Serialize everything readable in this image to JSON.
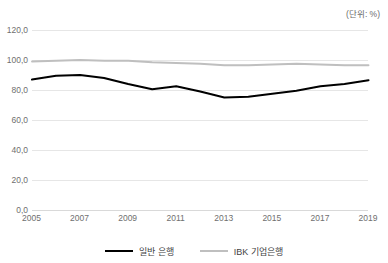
{
  "header": {
    "title_clipped": "",
    "unit_label": "(단위: %)"
  },
  "legend": {
    "position": "bottom",
    "items": [
      {
        "label": "일반 은행",
        "color": "#000000"
      },
      {
        "label": "IBK 기업은행",
        "color": "#bfbfbf"
      }
    ]
  },
  "axis": {
    "y_ticks": [
      "0,0",
      "20,0",
      "40,0",
      "60,0",
      "80,0",
      "100,0",
      "120,0"
    ],
    "x_ticks": [
      "2005",
      "2007",
      "2009",
      "2011",
      "2013",
      "2015",
      "2017",
      "2019"
    ]
  },
  "chart_data": {
    "type": "line",
    "title": "",
    "xlabel": "",
    "ylabel": "",
    "unit": "%",
    "ylim": [
      0,
      120
    ],
    "ytick_step": 20,
    "ytick_labels": [
      "0,0",
      "20,0",
      "40,0",
      "60,0",
      "80,0",
      "100,0",
      "120,0"
    ],
    "grid": true,
    "legend_position": "bottom",
    "x": [
      2005,
      2006,
      2007,
      2008,
      2009,
      2010,
      2011,
      2012,
      2013,
      2014,
      2015,
      2016,
      2017,
      2018,
      2019
    ],
    "xtick_labels": [
      "2005",
      "2007",
      "2009",
      "2011",
      "2013",
      "2015",
      "2017",
      "2019"
    ],
    "series": [
      {
        "name": "일반 은행",
        "color": "#000000",
        "values": [
          87.0,
          89.5,
          90.0,
          88.0,
          84.0,
          80.5,
          82.5,
          79.0,
          75.0,
          75.5,
          77.5,
          79.5,
          82.5,
          84.0,
          86.5
        ]
      },
      {
        "name": "IBK 기업은행",
        "color": "#bfbfbf",
        "values": [
          99.0,
          99.5,
          100.0,
          99.5,
          99.5,
          98.5,
          98.0,
          97.5,
          96.5,
          96.5,
          97.0,
          97.5,
          97.0,
          96.5,
          96.5
        ]
      }
    ]
  }
}
